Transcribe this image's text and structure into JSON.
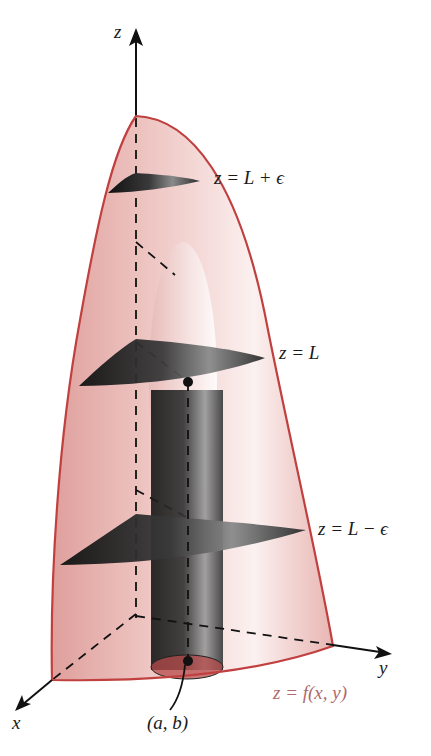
{
  "figure": {
    "axes": {
      "z_label": "z",
      "x_label": "x",
      "y_label": "y"
    },
    "planes": [
      {
        "label": "z = L + ϵ",
        "level": "upper"
      },
      {
        "label": "z = L",
        "level": "middle"
      },
      {
        "label": "z = L − ϵ",
        "level": "lower"
      }
    ],
    "surface_label": "z = f(x, y)",
    "point_label": "(a, b)",
    "colors": {
      "surface_edge": "#c0403f",
      "surface_fill": "#e8b4b0",
      "plane_dark": "#1e1e1e",
      "cylinder_dark": "#2a2a2a",
      "axis": "#111111",
      "surface_label": "#b06a6a"
    }
  }
}
